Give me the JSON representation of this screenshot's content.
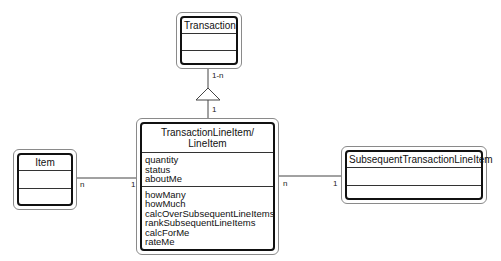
{
  "diagram": {
    "type": "UML class diagram",
    "classes": [
      {
        "id": "transaction",
        "name": "Transaction",
        "attributes": [],
        "operations": []
      },
      {
        "id": "line-item",
        "name_lines": [
          "TransactionLineItem/",
          "LineItem"
        ],
        "attributes": [
          "quantity",
          "status",
          "aboutMe"
        ],
        "operations": [
          "howMany",
          "howMuch",
          "calcOverSubsequentLineItems",
          "rankSubsequentLineItems",
          "calcForMe",
          "rateMe"
        ]
      },
      {
        "id": "item",
        "name": "Item",
        "attributes": [],
        "operations": []
      },
      {
        "id": "subsequent",
        "name": "SubsequentTransactionLineItem",
        "attributes": [],
        "operations": []
      }
    ],
    "relations": [
      {
        "from": "transaction",
        "to": "line-item",
        "kind": "composition-triangle",
        "from_mult": "1-n",
        "to_mult": "1"
      },
      {
        "from": "item",
        "to": "line-item",
        "kind": "association",
        "from_mult": "n",
        "to_mult": "1"
      },
      {
        "from": "line-item",
        "to": "subsequent",
        "kind": "association",
        "from_mult": "n",
        "to_mult": "1"
      }
    ]
  }
}
